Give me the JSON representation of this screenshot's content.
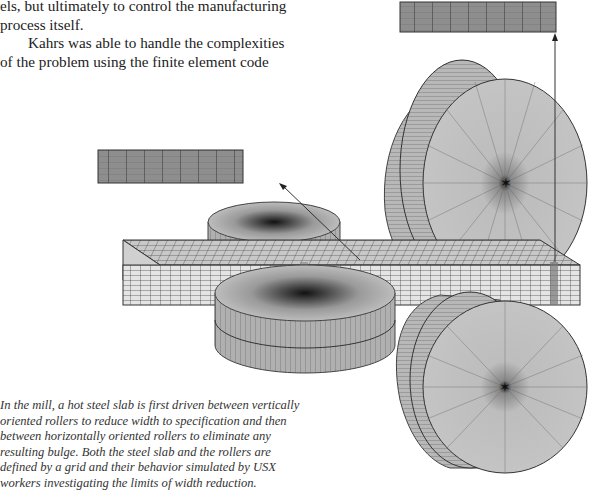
{
  "body_text": {
    "line1": "els, but ultimately to control the manufacturing process itself.",
    "para2": "Kahrs was able to handle the complexities of the problem using the finite element code"
  },
  "figure": {
    "elements": [
      "steel-slab-mesh",
      "vertical-roller-top",
      "vertical-roller-bottom",
      "horizontal-roller-top",
      "horizontal-roller-bottom",
      "cross-section-inset-left",
      "cross-section-inset-right"
    ],
    "colors": {
      "inset_fill": "#8e8e8e",
      "slab_fill": "#e2e2e2",
      "roller_fill": "#bdbdbd",
      "grid_line": "#333333"
    }
  },
  "caption": {
    "text": "In the mill, a hot steel slab is first driven between vertically oriented rollers to reduce width to specification and then between horizontally oriented rollers to eliminate any resulting bulge. Both the steel slab and the rollers are defined by a grid and their behavior simulated by USX workers investigating the limits of width reduction."
  }
}
